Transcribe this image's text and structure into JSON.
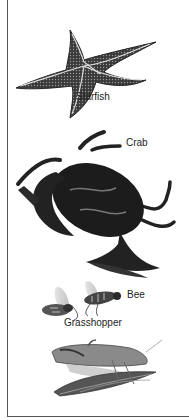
{
  "diagram": {
    "type": "labeled-illustration",
    "organisms": [
      {
        "id": "starfish",
        "label": "Starfish",
        "label_pos": [
          76,
          91
        ]
      },
      {
        "id": "crab",
        "label": "Crab",
        "label_pos": [
          126,
          137
        ]
      },
      {
        "id": "bee",
        "label": "Bee",
        "label_pos": [
          127,
          289
        ]
      },
      {
        "id": "grasshopper",
        "label": "Grasshopper",
        "label_pos": [
          64,
          317
        ]
      }
    ]
  }
}
